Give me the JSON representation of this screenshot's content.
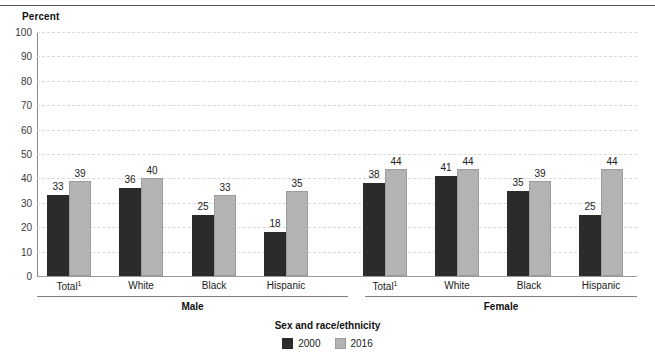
{
  "axis": {
    "y_title": "Percent",
    "x_title": "Sex and race/ethnicity"
  },
  "legend": {
    "items": [
      {
        "label": "2000",
        "color": "#2b2b2b",
        "swatch": "legend-swatch-2000"
      },
      {
        "label": "2016",
        "color": "#b3b3b3",
        "swatch": "legend-swatch-2016"
      }
    ]
  },
  "groups": [
    {
      "label": "Male"
    },
    {
      "label": "Female"
    }
  ],
  "yticks": [
    "0",
    "10",
    "20",
    "30",
    "40",
    "50",
    "60",
    "70",
    "80",
    "90",
    "100"
  ],
  "categories": [
    {
      "label": "Total",
      "note": "1"
    },
    {
      "label": "White",
      "note": ""
    },
    {
      "label": "Black",
      "note": ""
    },
    {
      "label": "Hispanic",
      "note": ""
    },
    {
      "label": "Total",
      "note": "1"
    },
    {
      "label": "White",
      "note": ""
    },
    {
      "label": "Black",
      "note": ""
    },
    {
      "label": "Hispanic",
      "note": ""
    }
  ],
  "bar_values": [
    {
      "v2000": "33",
      "v2016": "39"
    },
    {
      "v2000": "36",
      "v2016": "40"
    },
    {
      "v2000": "25",
      "v2016": "33"
    },
    {
      "v2000": "18",
      "v2016": "35"
    },
    {
      "v2000": "38",
      "v2016": "44"
    },
    {
      "v2000": "41",
      "v2016": "44"
    },
    {
      "v2000": "35",
      "v2016": "39"
    },
    {
      "v2000": "25",
      "v2016": "44"
    }
  ],
  "chart_data": {
    "type": "bar",
    "title": "",
    "xlabel": "Sex and race/ethnicity",
    "ylabel": "Percent",
    "ylim": [
      0,
      100
    ],
    "ytick_step": 10,
    "grid": true,
    "legend_position": "bottom-center",
    "group_labels": [
      "Male",
      "Female"
    ],
    "categories": [
      "Total¹",
      "White",
      "Black",
      "Hispanic",
      "Total¹",
      "White",
      "Black",
      "Hispanic"
    ],
    "series": [
      {
        "name": "2000",
        "color": "#2b2b2b",
        "values": [
          33,
          36,
          25,
          18,
          38,
          41,
          35,
          25
        ]
      },
      {
        "name": "2016",
        "color": "#b3b3b3",
        "values": [
          39,
          40,
          33,
          35,
          44,
          44,
          39,
          44
        ]
      }
    ]
  }
}
